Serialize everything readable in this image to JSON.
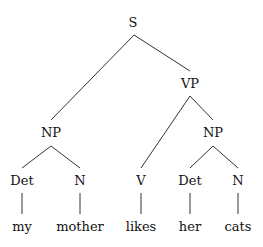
{
  "diagram": {
    "type": "syntax-tree",
    "nodes": [
      {
        "id": "S",
        "label": "S",
        "x": 133,
        "y": 27
      },
      {
        "id": "VP",
        "label": "VP",
        "x": 190,
        "y": 88
      },
      {
        "id": "NP1",
        "label": "NP",
        "x": 51,
        "y": 137
      },
      {
        "id": "NP2",
        "label": "NP",
        "x": 213,
        "y": 137
      },
      {
        "id": "Det1",
        "label": "Det",
        "x": 22,
        "y": 185
      },
      {
        "id": "N1",
        "label": "N",
        "x": 80,
        "y": 185
      },
      {
        "id": "V",
        "label": "V",
        "x": 141,
        "y": 185
      },
      {
        "id": "Det2",
        "label": "Det",
        "x": 190,
        "y": 185
      },
      {
        "id": "N2",
        "label": "N",
        "x": 238,
        "y": 185
      },
      {
        "id": "w1",
        "label": "my",
        "x": 22,
        "y": 231
      },
      {
        "id": "w2",
        "label": "mother",
        "x": 80,
        "y": 231
      },
      {
        "id": "w3",
        "label": "likes",
        "x": 141,
        "y": 231
      },
      {
        "id": "w4",
        "label": "her",
        "x": 190,
        "y": 231
      },
      {
        "id": "w5",
        "label": "cats",
        "x": 238,
        "y": 231
      }
    ],
    "edges": [
      {
        "x1": 134,
        "y1": 35,
        "x2": 51,
        "y2": 120
      },
      {
        "x1": 134,
        "y1": 35,
        "x2": 190,
        "y2": 71
      },
      {
        "x1": 190,
        "y1": 96,
        "x2": 141,
        "y2": 168
      },
      {
        "x1": 190,
        "y1": 96,
        "x2": 213,
        "y2": 120
      },
      {
        "x1": 51,
        "y1": 146,
        "x2": 22,
        "y2": 168
      },
      {
        "x1": 51,
        "y1": 146,
        "x2": 80,
        "y2": 168
      },
      {
        "x1": 213,
        "y1": 146,
        "x2": 190,
        "y2": 168
      },
      {
        "x1": 213,
        "y1": 146,
        "x2": 238,
        "y2": 168
      },
      {
        "x1": 22,
        "y1": 193,
        "x2": 22,
        "y2": 214
      },
      {
        "x1": 80,
        "y1": 193,
        "x2": 80,
        "y2": 214
      },
      {
        "x1": 141,
        "y1": 193,
        "x2": 141,
        "y2": 214
      },
      {
        "x1": 190,
        "y1": 193,
        "x2": 190,
        "y2": 214
      },
      {
        "x1": 238,
        "y1": 193,
        "x2": 238,
        "y2": 214
      }
    ]
  }
}
